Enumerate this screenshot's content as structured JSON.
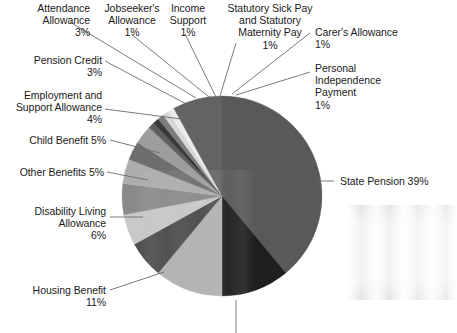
{
  "chart_data": {
    "type": "pie",
    "title": "",
    "subtitle": "",
    "xlabel": "",
    "ylabel": "",
    "legend_position": "none",
    "grid": false,
    "value_unit": "%",
    "categories": [
      "State Pension",
      "Housing Benefit",
      "Disability Living Allowance",
      "Other Benefits",
      "Child Benefit",
      "Employment and Support Allowance",
      "Pension Credit",
      "Attendance Allowance",
      "Jobseeker's Allowance",
      "Income Support",
      "Statutory Sick Pay and Statutory Maternity Pay",
      "Carer's Allowance",
      "Personal Independence Payment"
    ],
    "values": [
      39,
      11,
      6,
      5,
      5,
      4,
      3,
      3,
      1,
      1,
      1,
      1,
      1
    ],
    "slices": [
      {
        "name": "State Pension",
        "label": "State Pension 39%",
        "value": 39,
        "value_text": "39%",
        "color": "#595959",
        "start_deg": 0,
        "end_deg": 140.4
      },
      {
        "name": "Unlabelled Slice",
        "label": "",
        "value": 11,
        "value_text": "",
        "color": "#1f1f1f",
        "start_deg": 140.4,
        "end_deg": 180.0
      },
      {
        "name": "Housing Benefit",
        "label": "Housing Benefit\n11%",
        "value": 11,
        "value_text": "11%",
        "color": "#b2b2b2",
        "start_deg": 180.0,
        "end_deg": 219.6
      },
      {
        "name": "Disability Living Allowance",
        "label": "Disability Living\nAllowance\n6%",
        "value": 6,
        "value_text": "6%",
        "color": "#4a4a4a",
        "start_deg": 219.6,
        "end_deg": 241.2
      },
      {
        "name": "Other Benefits",
        "label": "Other Benefits 5%",
        "value": 5,
        "value_text": "5%",
        "color": "#c9c9c9",
        "start_deg": 241.2,
        "end_deg": 259.2
      },
      {
        "name": "Child Benefit",
        "label": "Child Benefit 5%",
        "value": 5,
        "value_text": "5%",
        "color": "#8a8a8a",
        "start_deg": 259.2,
        "end_deg": 277.2
      },
      {
        "name": "Employment and Support Allowance",
        "label": "Employment and\nSupport Allowance\n4%",
        "value": 4,
        "value_text": "4%",
        "color": "#adadad",
        "start_deg": 277.2,
        "end_deg": 291.6
      },
      {
        "name": "Pension Credit",
        "label": "Pension Credit\n3%",
        "value": 3,
        "value_text": "3%",
        "color": "#6e6e6e",
        "start_deg": 291.6,
        "end_deg": 302.4
      },
      {
        "name": "Attendance Allowance",
        "label": "Attendance\nAllowance\n3%",
        "value": 3,
        "value_text": "3%",
        "color": "#9d9d9d",
        "start_deg": 302.4,
        "end_deg": 313.2
      },
      {
        "name": "Jobseeker's Allowance",
        "label": "Jobseeker's\nAllowance\n1%",
        "value": 1,
        "value_text": "1%",
        "color": "#5f5f5f",
        "start_deg": 313.2,
        "end_deg": 316.8
      },
      {
        "name": "Income Support",
        "label": "Income\nSupport\n1%",
        "value": 1,
        "value_text": "1%",
        "color": "#3a3a3a",
        "start_deg": 316.8,
        "end_deg": 320.4
      },
      {
        "name": "Statutory Sick Pay and Statutory Maternity Pay",
        "label": "Statutory Sick Pay\nand Statutory\nMaternity Pay\n1%",
        "value": 1,
        "value_text": "1%",
        "color": "#7d7d7d",
        "start_deg": 320.4,
        "end_deg": 324.0
      },
      {
        "name": "Carer's Allowance",
        "label": "Carer's Allowance\n1%",
        "value": 1,
        "value_text": "1%",
        "color": "#d6d6d6",
        "start_deg": 324.0,
        "end_deg": 327.6
      },
      {
        "name": "Personal Independence Payment",
        "label": "Personal\nIndependence\nPayment\n1%",
        "value": 1,
        "value_text": "1%",
        "color": "#ebebeb",
        "start_deg": 327.6,
        "end_deg": 331.2
      },
      {
        "name": "Gap Slice",
        "label": "",
        "value": 8,
        "value_text": "",
        "color": "#636363",
        "start_deg": 331.2,
        "end_deg": 360.0
      }
    ]
  },
  "labels": {
    "attendance_allowance": "Attendance\nAllowance\n3%",
    "jobseekers_allowance": "Jobseeker's\nAllowance\n1%",
    "income_support": "Income\nSupport\n1%",
    "statutory_pay": "Statutory Sick Pay\nand Statutory\nMaternity Pay\n1%",
    "carers_allowance": "Carer's Allowance\n1%",
    "personal_independence_payment": "Personal\nIndependence\nPayment\n1%",
    "pension_credit": "Pension Credit\n3%",
    "employment_support_allowance": "Employment and\nSupport Allowance\n4%",
    "child_benefit": "Child Benefit 5%",
    "other_benefits": "Other Benefits 5%",
    "disability_living_allowance": "Disability Living\nAllowance\n6%",
    "housing_benefit": "Housing Benefit\n11%",
    "state_pension": "State Pension 39%"
  },
  "colors": {
    "background": "#ffffff",
    "text": "#1a1a1a",
    "leader_line": "#6b6b6b"
  }
}
